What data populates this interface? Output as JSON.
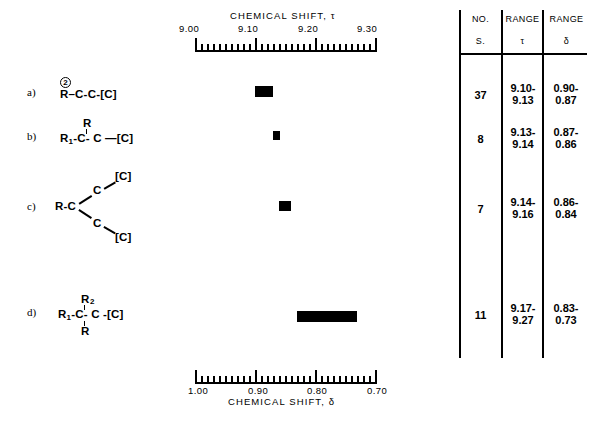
{
  "figure": {
    "top_axis": {
      "title": "CHEMICAL  SHIFT, τ",
      "labels": [
        "9.00",
        "9.10",
        "9.20",
        "9.30"
      ],
      "min": 9.0,
      "max": 9.3,
      "major_step": 0.1,
      "minor_step": 0.01
    },
    "bottom_axis": {
      "title": "CHEMICAL  SHIFT, δ",
      "labels": [
        "1.00",
        "0.90",
        "0.80",
        "0.70"
      ],
      "min": 0.7,
      "max": 1.0,
      "major_step": 0.1,
      "minor_step": 0.01
    },
    "rows": [
      {
        "key": "a",
        "label": "a)",
        "formula_plain": "R②-C-C-[C]",
        "parts": {
          "stem": "R",
          "circle_super": "2",
          "chain": "–C-C-[C]"
        }
      },
      {
        "key": "b",
        "label": "b)",
        "formula_plain": "R1-C(R)-C—[C]",
        "parts": {
          "left": "R",
          "left_sub": "1",
          "center": "-C- C —[C]",
          "above": "R"
        }
      },
      {
        "key": "c",
        "label": "c)",
        "formula_plain": "R-C(-C-[C])(-C-[C])",
        "parts": {
          "stem": "R-C",
          "branch_atom": "C",
          "branch_end": "[C]"
        }
      },
      {
        "key": "d",
        "label": "d)",
        "formula_plain": "R1-C(R2)(R)-C-[C]",
        "parts": {
          "left": "R",
          "left_sub": "1",
          "center": "-C- C -[C]",
          "above": "R",
          "above_sub": "2",
          "below": "R"
        }
      }
    ]
  },
  "chart_data": {
    "type": "bar",
    "title": "CHEMICAL  SHIFT, τ",
    "xlabel": "CHEMICAL  SHIFT, τ",
    "ylabel": "",
    "orientation": "horizontal-ranges",
    "xlim": [
      9.0,
      9.3
    ],
    "secondary_xlabel": "CHEMICAL  SHIFT, δ",
    "secondary_xlim": [
      1.0,
      0.7
    ],
    "grid": false,
    "legend": "none",
    "categories": [
      "a",
      "b",
      "c",
      "d"
    ],
    "series": [
      {
        "name": "tau range",
        "bars": [
          {
            "category": "a",
            "start": 9.1,
            "end": 9.13,
            "delta_start": 0.9,
            "delta_end": 0.87,
            "count": 37
          },
          {
            "category": "b",
            "start": 9.13,
            "end": 9.14,
            "delta_start": 0.87,
            "delta_end": 0.86,
            "count": 8
          },
          {
            "category": "c",
            "start": 9.14,
            "end": 9.16,
            "delta_start": 0.86,
            "delta_end": 0.84,
            "count": 7
          },
          {
            "category": "d",
            "start": 9.17,
            "end": 9.27,
            "delta_start": 0.83,
            "delta_end": 0.73,
            "count": 11
          }
        ]
      }
    ]
  },
  "table": {
    "headers": [
      {
        "line1": "NO.",
        "line2": "S."
      },
      {
        "line1": "RANGE",
        "line2": "τ"
      },
      {
        "line1": "RANGE",
        "line2": "δ"
      }
    ],
    "rows": [
      {
        "no": "37",
        "tau": "9.10-\n9.13",
        "tau_l1": "9.10-",
        "tau_l2": "9.13",
        "delta_l1": "0.90-",
        "delta_l2": "0.87"
      },
      {
        "no": "8",
        "tau_l1": "9.13-",
        "tau_l2": "9.14",
        "delta_l1": "0.87-",
        "delta_l2": "0.86"
      },
      {
        "no": "7",
        "tau_l1": "9.14-",
        "tau_l2": "9.16",
        "delta_l1": "0.86-",
        "delta_l2": "0.84"
      },
      {
        "no": "11",
        "tau_l1": "9.17-",
        "tau_l2": "9.27",
        "delta_l1": "0.83-",
        "delta_l2": "0.73"
      }
    ]
  },
  "colors": {
    "ink": "#000000",
    "paper": "#ffffff"
  }
}
